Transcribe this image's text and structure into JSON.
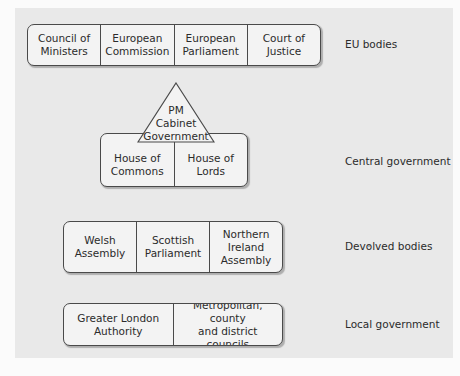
{
  "levels": [
    {
      "id": "eu",
      "label": "EU bodies",
      "cells": [
        "Council of\nMinisters",
        "European\nCommission",
        "European\nParliament",
        "Court of\nJustice"
      ]
    },
    {
      "id": "central",
      "label": "Central government",
      "apex": "PM\nCabinet\nGovernment",
      "cells": [
        "House of\nCommons",
        "House of\nLords"
      ]
    },
    {
      "id": "devolved",
      "label": "Devolved bodies",
      "cells": [
        "Welsh\nAssembly",
        "Scottish\nParliament",
        "Northern\nIreland\nAssembly"
      ]
    },
    {
      "id": "local",
      "label": "Local government",
      "cells": [
        "Greater London\nAuthority",
        "Metropolitan, county\nand district councils"
      ]
    }
  ],
  "colors": {
    "panel": "#e9e9e9",
    "box_fill": "#f3f3f3",
    "border": "#4a4a4a",
    "text": "#2b2b2b"
  }
}
